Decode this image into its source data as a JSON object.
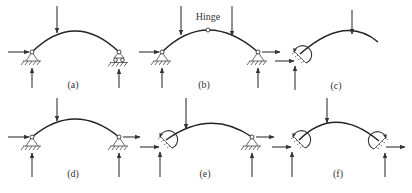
{
  "figure": {
    "colors": {
      "ink": "#333333",
      "background": "#ffffff"
    },
    "panels": [
      {
        "id": "a",
        "label": "(a)",
        "supports": [
          "pin",
          "roller"
        ],
        "loads": 1,
        "hinge": false
      },
      {
        "id": "b",
        "label": "(b)",
        "supports": [
          "pin",
          "pin"
        ],
        "loads": 2,
        "hinge": true,
        "hinge_label": "Hinge"
      },
      {
        "id": "c",
        "label": "(c)",
        "supports": [
          "fixed",
          "free"
        ],
        "loads": 1,
        "hinge": false
      },
      {
        "id": "d",
        "label": "(d)",
        "supports": [
          "pin",
          "pin"
        ],
        "loads": 1,
        "hinge": false
      },
      {
        "id": "e",
        "label": "(e)",
        "supports": [
          "fixed",
          "pin"
        ],
        "loads": 1,
        "hinge": false
      },
      {
        "id": "f",
        "label": "(f)",
        "supports": [
          "fixed",
          "fixed"
        ],
        "loads": 1,
        "hinge": false
      }
    ]
  }
}
